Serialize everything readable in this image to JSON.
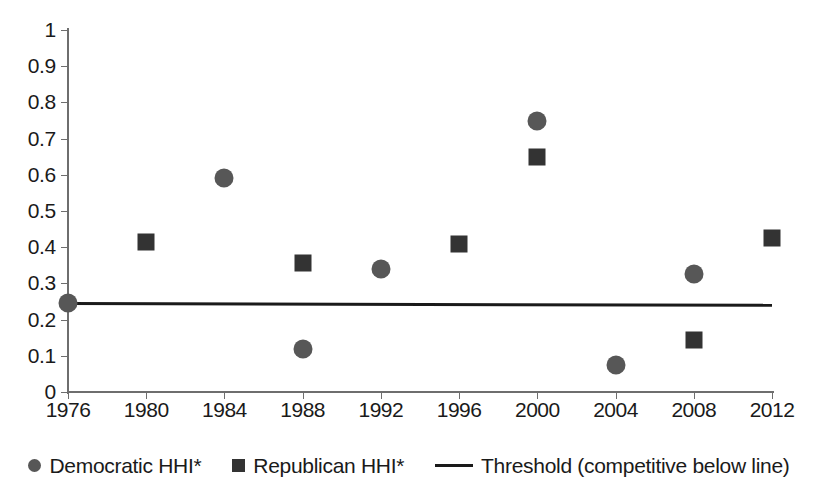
{
  "chart_data": {
    "type": "scatter",
    "title": "",
    "xlabel": "",
    "ylabel": "",
    "xlim": [
      1976,
      2012
    ],
    "ylim": [
      0,
      1
    ],
    "grid": false,
    "legend_position": "bottom",
    "x_tick_labels": [
      "1976",
      "1980",
      "1984",
      "1988",
      "1992",
      "1996",
      "2000",
      "2004",
      "2008",
      "2012"
    ],
    "y_tick_labels": [
      "0",
      "0.1",
      "0.2",
      "0.3",
      "0.4",
      "0.5",
      "0.6",
      "0.7",
      "0.8",
      "0.9",
      "1"
    ],
    "x": [
      1976,
      1980,
      1984,
      1988,
      1992,
      1996,
      2000,
      2004,
      2008,
      2012
    ],
    "series": [
      {
        "name": "Democratic HHI*",
        "marker": "circle",
        "color": "#575757",
        "points": [
          {
            "x": 1976,
            "y": 0.245
          },
          {
            "x": 1984,
            "y": 0.59
          },
          {
            "x": 1988,
            "y": 0.12
          },
          {
            "x": 1992,
            "y": 0.34
          },
          {
            "x": 2000,
            "y": 0.75
          },
          {
            "x": 2004,
            "y": 0.075
          },
          {
            "x": 2008,
            "y": 0.325
          }
        ]
      },
      {
        "name": "Republican HHI*",
        "marker": "square",
        "color": "#333333",
        "points": [
          {
            "x": 1980,
            "y": 0.415
          },
          {
            "x": 1988,
            "y": 0.355
          },
          {
            "x": 1996,
            "y": 0.41
          },
          {
            "x": 2000,
            "y": 0.65
          },
          {
            "x": 2008,
            "y": 0.145
          },
          {
            "x": 2012,
            "y": 0.425
          }
        ]
      },
      {
        "name": "Threshold (competitive below line)",
        "marker": "line",
        "color": "#1a1a1a",
        "points": [
          {
            "x": 1976,
            "y": 0.2485
          },
          {
            "x": 2012,
            "y": 0.2435
          }
        ]
      }
    ]
  },
  "legend": {
    "items": [
      {
        "label": "Democratic HHI*",
        "marker": "circle",
        "color": "#575757"
      },
      {
        "label": "Republican HHI*",
        "marker": "square",
        "color": "#333333"
      },
      {
        "label": "Threshold (competitive below line)",
        "marker": "line",
        "color": "#1a1a1a"
      }
    ]
  },
  "axis_colors": {
    "axis": "#6e6e6e",
    "text": "#1a1a1a"
  }
}
